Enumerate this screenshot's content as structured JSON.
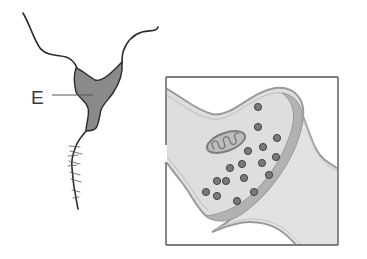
{
  "diagram": {
    "type": "neuron-and-synapse",
    "labels": [
      {
        "id": "E",
        "text": "E",
        "target": "neuron-cell-body"
      }
    ],
    "colors": {
      "background": "#ffffff",
      "outline": "#2b2b2b",
      "cell_body_fill": "#8a8a8a",
      "synapse_fill": "#dcdcdc",
      "synapse_membrane": "#9a9a9a",
      "synaptic_cleft_band": "#b4b4b4",
      "vesicle_fill": "#7a7a7a",
      "vesicle_outline": "#3a3a3a",
      "frame": "#555555"
    },
    "synapse_inset": {
      "frame": {
        "x": 166,
        "y": 77,
        "width": 172,
        "height": 168
      },
      "vesicle_count": 17,
      "contains": [
        "presynaptic-terminal",
        "mitochondrion",
        "synaptic-vesicles",
        "synaptic-cleft",
        "postsynaptic-membrane"
      ]
    }
  }
}
